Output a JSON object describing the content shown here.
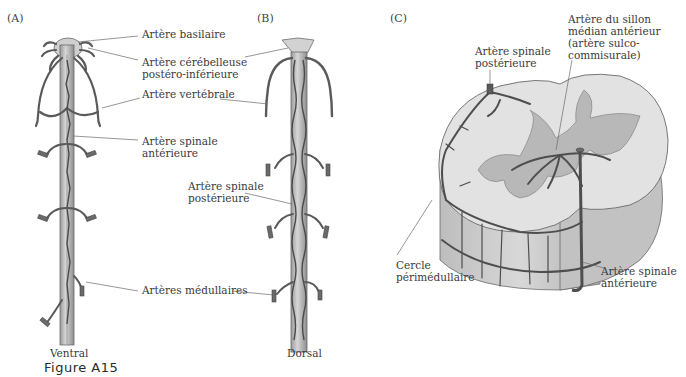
{
  "figure": {
    "label": "Figure A15",
    "panels": [
      {
        "id": "A",
        "letter": "(A)",
        "caption": "Ventral"
      },
      {
        "id": "B",
        "letter": "(B)",
        "caption": "Dorsal"
      },
      {
        "id": "C",
        "letter": "(C)",
        "caption": ""
      }
    ]
  },
  "labels": {
    "basilar": "Artère basilaire",
    "pica_line1": "Artère cérébelleuse",
    "pica_line2": "postéro-inférieure",
    "vertebral": "Artère vertébrale",
    "anterior_spinal_line1": "Artère spinale",
    "anterior_spinal_line2": "antérieure",
    "posterior_spinal_line1": "Artère spinale",
    "posterior_spinal_line2": "postérieure",
    "medullary": "Artères médullaires",
    "c_posterior_spinal_line1": "Artère spinale",
    "c_posterior_spinal_line2": "postérieure",
    "sulcal_line1": "Artère du sillon",
    "sulcal_line2": "médian antérieur",
    "sulcal_line3": "(artère sulco-",
    "sulcal_line4": "commisurale)",
    "perimedullary_line1": "Cercle",
    "perimedullary_line2": "périmédullaire",
    "c_anterior_spinal_line1": "Artère spinale",
    "c_anterior_spinal_line2": "antérieure"
  },
  "colors": {
    "vessel": "#5a5a5a",
    "cord": "#c8c8c8",
    "grey_matter": "#b4b4b4",
    "white_matter": "#dedede",
    "leader": "#6a6a6a"
  }
}
